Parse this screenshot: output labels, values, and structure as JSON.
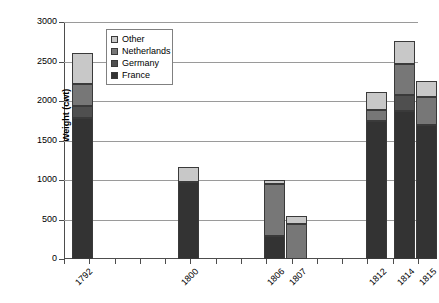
{
  "chart_data": {
    "type": "bar",
    "subtype": "stacked-column",
    "title": "",
    "xlabel": "",
    "ylabel": "Weight (cwt)",
    "ylim": [
      0,
      3000
    ],
    "ytick_step": 500,
    "yticks": [
      "3000",
      "2500",
      "2000",
      "1500",
      "1000",
      "500",
      "0"
    ],
    "grid": true,
    "legend_position": "top-left-inside",
    "categories": [
      "1792",
      "1800",
      "1806",
      "1807",
      "1812",
      "1814",
      "1815"
    ],
    "series": [
      {
        "name": "France",
        "color": "#333333",
        "values": [
          1790,
          980,
          290,
          0,
          1750,
          1870,
          1700
        ]
      },
      {
        "name": "Germany",
        "color": "#4f4f4f",
        "values": [
          150,
          0,
          0,
          0,
          0,
          200,
          0
        ]
      },
      {
        "name": "Netherlands",
        "color": "#777777",
        "values": [
          280,
          0,
          660,
          440,
          130,
          400,
          350
        ]
      },
      {
        "name": "Other",
        "color": "#c8c8c8",
        "values": [
          390,
          190,
          50,
          110,
          230,
          290,
          200
        ]
      }
    ],
    "totals": [
      2610,
      1170,
      1000,
      550,
      2110,
      2760,
      2250
    ]
  },
  "legend": {
    "items": [
      {
        "label": "Other"
      },
      {
        "label": "Netherlands"
      },
      {
        "label": "Germany"
      },
      {
        "label": "France"
      }
    ]
  }
}
